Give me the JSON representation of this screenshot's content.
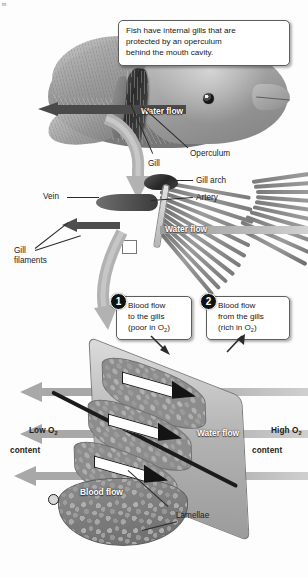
{
  "figure": {
    "intro_box": "Fish have internal gills that are\nprotected by an operculum\nbehind the mouth cavity.",
    "corner_mark": "m"
  },
  "panel_fish": {
    "water_flow_label": "Water flow",
    "labels": {
      "operculum": "Operculum",
      "gill": "Gill"
    }
  },
  "panel_gill": {
    "water_flow_label": "Water flow",
    "labels": {
      "gill_arch": "Gill arch",
      "artery": "Artery",
      "vein": "Vein",
      "gill_filaments_line1": "Gill",
      "gill_filaments_line2": "filaments"
    }
  },
  "callouts": [
    {
      "number": "1",
      "line1": "Blood flow",
      "line2": "to the gills",
      "line3_prefix": "(poor in O",
      "line3_sub": "2",
      "line3_suffix": ")"
    },
    {
      "number": "2",
      "line1": "Blood flow",
      "line2": "from the gills",
      "line3_prefix": "(rich in O",
      "line3_sub": "2",
      "line3_suffix": ")"
    }
  ],
  "panel_lamellae": {
    "water_flow_label": "Water flow",
    "blood_flow_label": "Blood flow",
    "lamellae_label": "Lamellae",
    "low_o2": {
      "line1_prefix": "Low O",
      "line1_sub": "2",
      "line2": "content"
    },
    "high_o2": {
      "line1_prefix": "High O",
      "line1_sub": "2",
      "line2": "content"
    }
  },
  "colors": {
    "arrow_dark": "#4a4a4a",
    "arrow_gray": "#a8a8a8",
    "badge_bg": "#101010",
    "text": "#1a1a1a",
    "box_border": "#5d5d5d",
    "background": "#ffffff"
  }
}
